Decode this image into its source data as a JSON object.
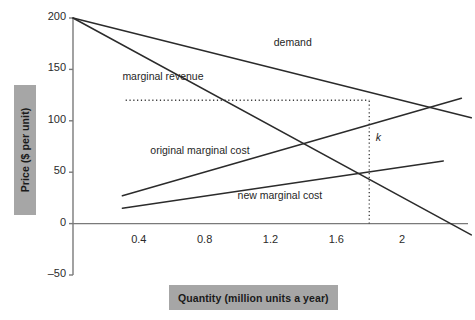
{
  "chart_data": {
    "type": "line",
    "title": "",
    "xlabel": "Quantity (million units a year)",
    "ylabel": "Price ($ per unit)",
    "xlim": [
      0,
      2.4
    ],
    "ylim": [
      -50,
      200
    ],
    "xticks": [
      0.4,
      0.8,
      1.2,
      1.6,
      2
    ],
    "xtick_labels": [
      "0.4",
      "0.8",
      "1.2",
      "1.6",
      "2"
    ],
    "yticks": [
      -50,
      0,
      50,
      100,
      150,
      200
    ],
    "ytick_labels": [
      "–50",
      "0",
      "50",
      "100",
      "150",
      "200"
    ],
    "grid": false,
    "legend": "inline-labels",
    "line_color": "#2b2b2b",
    "axis_color": "#7a7a7a",
    "label_box_color": "#a6a6a6",
    "series": [
      {
        "name": "demand",
        "label": "demand",
        "points": [
          [
            0.0,
            200
          ],
          [
            2.42,
            103
          ]
        ],
        "label_x": 1.22,
        "label_y": 176
      },
      {
        "name": "marginal revenue",
        "label": "marginal revenue",
        "points": [
          [
            0.0,
            200
          ],
          [
            2.42,
            -11
          ]
        ],
        "label_x": 0.3,
        "label_y": 143
      },
      {
        "name": "original marginal cost",
        "label": "original marginal cost",
        "points": [
          [
            0.3,
            27
          ],
          [
            2.36,
            122
          ]
        ],
        "label_x": 0.47,
        "label_y": 71
      },
      {
        "name": "new marginal cost",
        "label": "new marginal cost",
        "points": [
          [
            0.3,
            15
          ],
          [
            2.25,
            61
          ]
        ],
        "label_x": 1.0,
        "label_y": 27
      }
    ],
    "annotations": [
      {
        "name": "k",
        "label": "k",
        "x": 1.8,
        "y": 70,
        "label_x": 1.84,
        "label_y": 83,
        "guides": {
          "horizontal_price": 120,
          "horizontal_from_x": 0.32,
          "horizontal_to_x": 1.8,
          "vertical_quantity": 1.8,
          "vertical_from_y": 0,
          "vertical_to_y": 120
        }
      }
    ]
  }
}
